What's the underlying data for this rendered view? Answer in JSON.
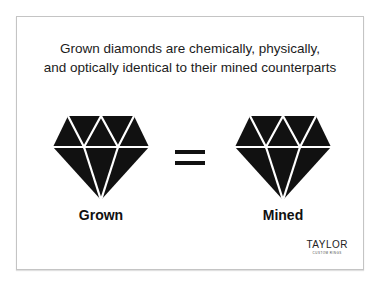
{
  "headline": {
    "line1": "Grown diamonds are chemically, physically,",
    "line2": "and optically identical to their mined counterparts"
  },
  "left": {
    "label": "Grown",
    "icon": "diamond-icon"
  },
  "center": {
    "icon": "equals-icon"
  },
  "right": {
    "label": "Mined",
    "icon": "diamond-icon"
  },
  "logo": {
    "name": "TAYLOR",
    "tagline": "CUSTOM RINGS"
  },
  "colors": {
    "ink": "#111111",
    "border": "#c4c4c4",
    "background": "#ffffff"
  }
}
